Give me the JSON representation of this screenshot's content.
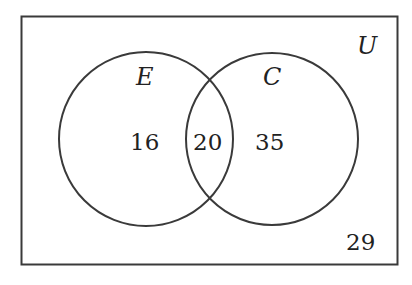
{
  "diagram": {
    "type": "venn",
    "universe_label": "U",
    "sets": [
      {
        "label": "E"
      },
      {
        "label": "C"
      }
    ],
    "regions": {
      "E_only": "16",
      "E_and_C": "20",
      "C_only": "35",
      "neither": "29"
    },
    "colors": {
      "stroke": "#3a3a3a",
      "text": "#222222",
      "background": "#ffffff"
    }
  }
}
